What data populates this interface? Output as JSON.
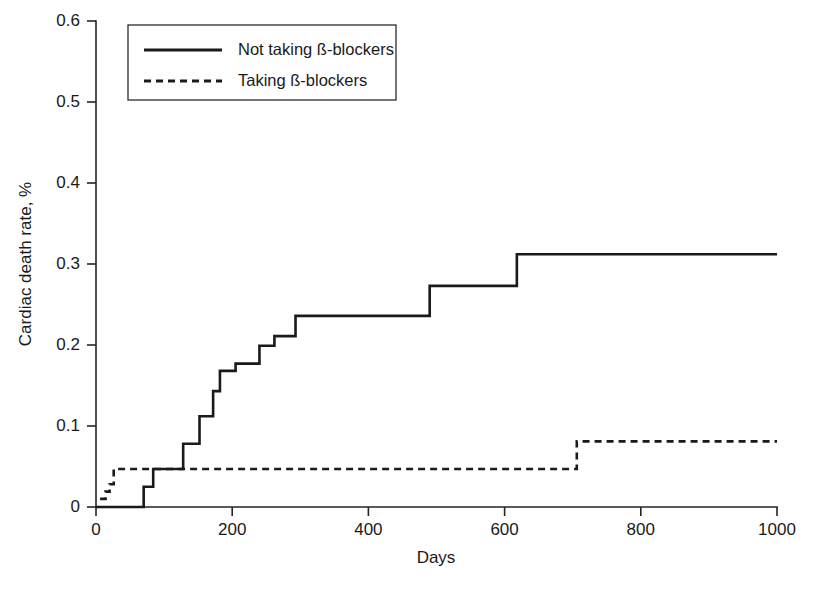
{
  "chart_data": {
    "type": "line",
    "subtype": "step-kaplan-meier-cumulative-incidence",
    "title": "",
    "xlabel": "Days",
    "ylabel": "Cardiac death rate, %",
    "xlim": [
      0,
      1000
    ],
    "ylim": [
      0,
      0.6
    ],
    "xticks": [
      0,
      200,
      400,
      600,
      800,
      1000
    ],
    "xticklabels": [
      "0",
      "200",
      "400",
      "600",
      "800",
      "1000"
    ],
    "yticks": [
      0,
      0.1,
      0.2,
      0.3,
      0.4,
      0.5,
      0.6
    ],
    "yticklabels": [
      "0",
      "0.1",
      "0.2",
      "0.3",
      "0.4",
      "0.5",
      "0.6"
    ],
    "grid": false,
    "legend_position": "upper-left-inside",
    "series": [
      {
        "name": "Not taking ß-blockers",
        "style": "solid",
        "color": "#1a1a1a",
        "steps": [
          {
            "x": 0,
            "y": 0.0
          },
          {
            "x": 70,
            "y": 0.0
          },
          {
            "x": 70,
            "y": 0.025
          },
          {
            "x": 84,
            "y": 0.025
          },
          {
            "x": 84,
            "y": 0.047
          },
          {
            "x": 128,
            "y": 0.047
          },
          {
            "x": 128,
            "y": 0.078
          },
          {
            "x": 152,
            "y": 0.078
          },
          {
            "x": 152,
            "y": 0.112
          },
          {
            "x": 172,
            "y": 0.112
          },
          {
            "x": 172,
            "y": 0.143
          },
          {
            "x": 182,
            "y": 0.143
          },
          {
            "x": 182,
            "y": 0.168
          },
          {
            "x": 205,
            "y": 0.168
          },
          {
            "x": 205,
            "y": 0.177
          },
          {
            "x": 240,
            "y": 0.177
          },
          {
            "x": 240,
            "y": 0.199
          },
          {
            "x": 262,
            "y": 0.199
          },
          {
            "x": 262,
            "y": 0.211
          },
          {
            "x": 293,
            "y": 0.211
          },
          {
            "x": 293,
            "y": 0.236
          },
          {
            "x": 490,
            "y": 0.236
          },
          {
            "x": 490,
            "y": 0.273
          },
          {
            "x": 618,
            "y": 0.273
          },
          {
            "x": 618,
            "y": 0.312
          },
          {
            "x": 1000,
            "y": 0.312
          }
        ]
      },
      {
        "name": "Taking ß-blockers",
        "style": "dashed",
        "color": "#1a1a1a",
        "steps": [
          {
            "x": 6,
            "y": 0.01
          },
          {
            "x": 14,
            "y": 0.01
          },
          {
            "x": 14,
            "y": 0.019
          },
          {
            "x": 20,
            "y": 0.019
          },
          {
            "x": 20,
            "y": 0.028
          },
          {
            "x": 26,
            "y": 0.028
          },
          {
            "x": 26,
            "y": 0.047
          },
          {
            "x": 706,
            "y": 0.047
          },
          {
            "x": 706,
            "y": 0.081
          },
          {
            "x": 1000,
            "y": 0.081
          }
        ]
      }
    ],
    "legend_entries": [
      {
        "label": "Not taking ß-blockers",
        "style": "solid"
      },
      {
        "label": "Taking ß-blockers",
        "style": "dashed"
      }
    ]
  }
}
